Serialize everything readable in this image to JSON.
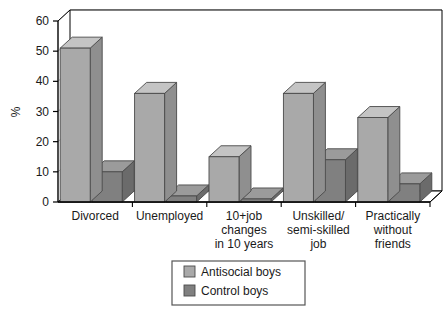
{
  "chart_data": {
    "type": "bar",
    "title": "",
    "subtitle": "",
    "xlabel": "",
    "ylabel": "%",
    "ylim": [
      0,
      60
    ],
    "yticks": [
      0,
      10,
      20,
      30,
      40,
      50,
      60
    ],
    "ytick_labels": [
      "0",
      "10",
      "20",
      "30",
      "40",
      "50",
      "60"
    ],
    "grid": true,
    "grid_axis": "y",
    "legend_position": "bottom-center",
    "style": "3d-grouped-bar",
    "categories": [
      "Divorced",
      "Unemployed",
      "10+job changes in 10 years",
      "Unskilled/ semi-skilled job",
      "Practically without friends"
    ],
    "category_label_lines": [
      [
        "Divorced"
      ],
      [
        "Unemployed"
      ],
      [
        "10+job",
        "changes",
        "in 10 years"
      ],
      [
        "Unskilled/",
        "semi-skilled",
        "job"
      ],
      [
        "Practically",
        "without",
        "friends"
      ]
    ],
    "series": [
      {
        "name": "Antisocial boys",
        "color": "#a9a9a9",
        "values": [
          51,
          36,
          15,
          36,
          28
        ]
      },
      {
        "name": "Control boys",
        "color": "#808080",
        "values": [
          10,
          2,
          1,
          14,
          6
        ]
      }
    ]
  },
  "legend": {
    "items": [
      {
        "label": "Antisocial boys",
        "color": "#a9a9a9"
      },
      {
        "label": "Control boys",
        "color": "#808080"
      }
    ]
  },
  "colors": {
    "series_antisocial": "#a9a9a9",
    "series_control": "#808080",
    "antisocial_top": "#c4c4c4",
    "antisocial_side": "#8f8f8f",
    "control_top": "#9b9b9b",
    "control_side": "#6b6b6b",
    "axis": "#000000",
    "grid": "#b0b0b0",
    "plot_background": "#ffffff",
    "text": "#1a1a1a"
  }
}
